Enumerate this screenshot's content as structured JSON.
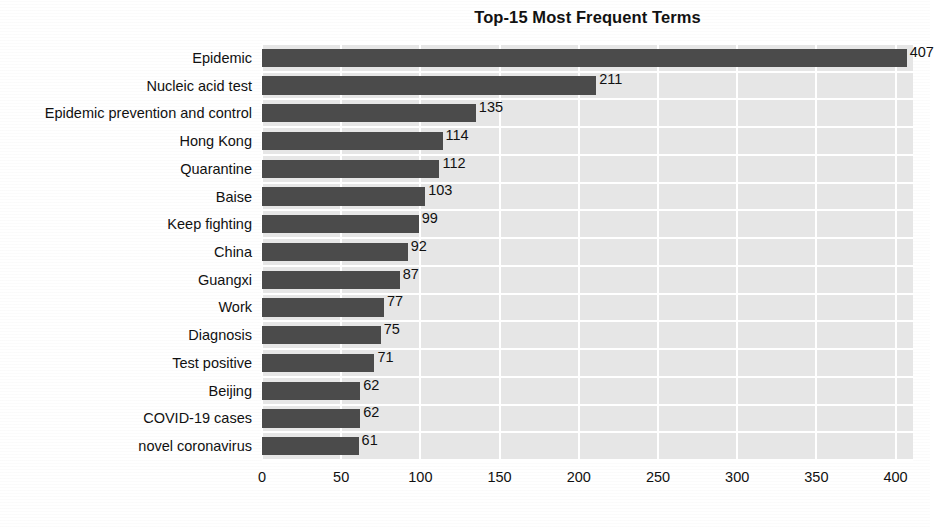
{
  "chart_data": {
    "type": "bar",
    "orientation": "horizontal",
    "title": "Top-15 Most Frequent Terms",
    "xlabel": "",
    "ylabel": "",
    "xlim": [
      0,
      411
    ],
    "xticks": [
      0,
      50,
      100,
      150,
      200,
      250,
      300,
      350,
      400
    ],
    "xtick_labels": [
      "0",
      "50",
      "100",
      "150",
      "200",
      "250",
      "300",
      "350",
      "400"
    ],
    "grid": true,
    "grid_axis": "both",
    "legend": false,
    "bar_color": "#4b4b4b",
    "plot_background": "#e6e6e6",
    "gridline_color": "#ffffff",
    "categories": [
      "Epidemic",
      "Nucleic acid test",
      "Epidemic prevention and control",
      "Hong Kong",
      "Quarantine",
      "Baise",
      "Keep fighting",
      "China",
      "Guangxi",
      "Work",
      "Diagnosis",
      "Test positive",
      "Beijing",
      "COVID-19 cases",
      "novel coronavirus"
    ],
    "values": [
      407,
      211,
      135,
      114,
      112,
      103,
      99,
      92,
      87,
      77,
      75,
      71,
      62,
      62,
      61
    ],
    "value_labels": [
      "407",
      "211",
      "135",
      "114",
      "112",
      "103",
      "99",
      "92",
      "87",
      "77",
      "75",
      "71",
      "62",
      "62",
      "61"
    ]
  },
  "caption": {
    "text": ""
  }
}
